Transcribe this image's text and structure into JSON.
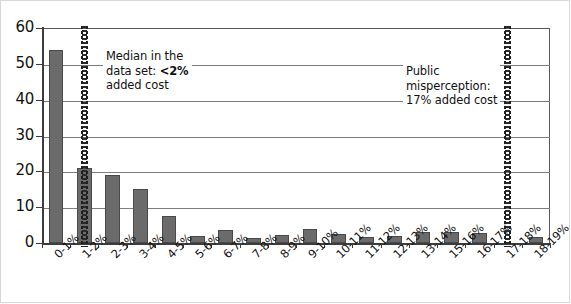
{
  "chart_data": {
    "type": "bar",
    "title": "",
    "xlabel": "",
    "ylabel": "",
    "ylim": [
      0,
      60
    ],
    "yticks": [
      0,
      10,
      20,
      30,
      40,
      50,
      60
    ],
    "grid": true,
    "legend": "none",
    "bar_color": "#6b6b6b",
    "categories": [
      "0-1%",
      "1-2%",
      "2-3%",
      "3-4%",
      "4-5%",
      "5-6%",
      "6-7%",
      "7-8%",
      "8-9%",
      "9-10%",
      "10-11%",
      "11-12%",
      "12-13%",
      "13-14%",
      "15-16%",
      "16-17%",
      "17-18%",
      "18-19%"
    ],
    "values": [
      54,
      21,
      19,
      15,
      7.5,
      2,
      3.7,
      1.5,
      2.3,
      4,
      2.5,
      1.7,
      2,
      3,
      3,
      2.8,
      0,
      1.8
    ],
    "annotations": [
      {
        "id": "median-callout",
        "text_line1": "Median in the",
        "text_line2_prefix": "data set: ",
        "text_line2_bold": "<2%",
        "text_line3": "added cost",
        "marker_category": "1-2%",
        "marker_style": "dotted-vertical"
      },
      {
        "id": "misperception-callout",
        "text_line1": "Public",
        "text_line2": "misperception:",
        "text_line3": "17% added cost",
        "marker_category": "17-18%",
        "marker_style": "dotted-vertical"
      }
    ]
  }
}
